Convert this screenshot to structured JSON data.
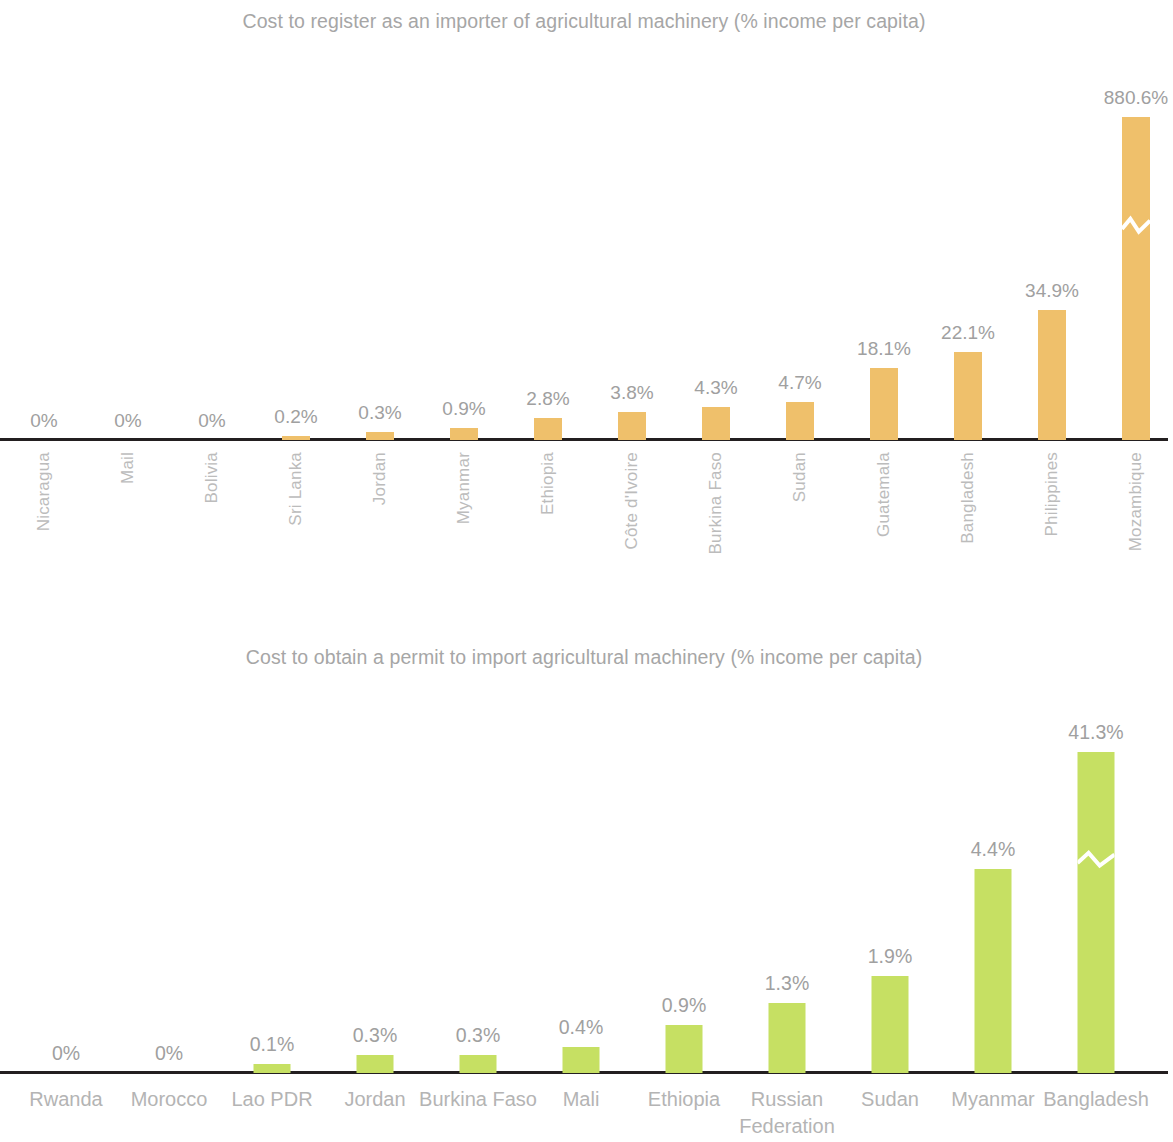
{
  "chart_data": [
    {
      "type": "bar",
      "title": "Cost to register as an importer of agricultural machinery (% income per capita)",
      "xlabel": "",
      "ylabel": "% income per capita",
      "grid": false,
      "legend": "none",
      "axis_break": true,
      "axis_break_category": "Mozambique",
      "bar_color": "#efc06b",
      "label_color": "#a0a0a0",
      "axis_color": "#231f20",
      "tick_label_orientation": "vertical",
      "categories": [
        "Nicaragua",
        "Mail",
        "Bolivia",
        "Sri Lanka",
        "Jordan",
        "Myanmar",
        "Ethiopia",
        "Côte d'Ivoire",
        "Burkina Faso",
        "Sudan",
        "Guatemala",
        "Bangladesh",
        "Philippines",
        "Mozambique"
      ],
      "values": [
        0,
        0,
        0,
        0.2,
        0.3,
        0.9,
        2.8,
        3.8,
        4.3,
        4.7,
        18.1,
        22.1,
        34.9,
        880.6
      ],
      "value_labels": [
        "0%",
        "0%",
        "0%",
        "0.2%",
        "0.3%",
        "0.9%",
        "2.8%",
        "3.8%",
        "4.3%",
        "4.7%",
        "18.1%",
        "22.1%",
        "34.9%",
        "880.6%"
      ],
      "bar_pixel_heights": [
        0,
        0,
        0,
        4,
        8,
        12,
        22,
        28,
        33,
        38,
        72,
        88,
        130,
        323
      ],
      "ylim": [
        0,
        900
      ]
    },
    {
      "type": "bar",
      "title": "Cost to obtain a permit to import agricultural machinery (% income per capita)",
      "xlabel": "",
      "ylabel": "% income per capita",
      "grid": false,
      "legend": "none",
      "axis_break": true,
      "axis_break_category": "Bangladesh",
      "bar_color": "#c6e063",
      "label_color": "#a0a0a0",
      "axis_color": "#231f20",
      "tick_label_orientation": "horizontal",
      "categories": [
        "Rwanda",
        "Morocco",
        "Lao PDR",
        "Jordan",
        "Burkina Faso",
        "Mali",
        "Ethiopia",
        "Russian Federation",
        "Sudan",
        "Myanmar",
        "Bangladesh"
      ],
      "values": [
        0,
        0,
        0.1,
        0.3,
        0.3,
        0.4,
        0.9,
        1.3,
        1.9,
        4.4,
        41.3
      ],
      "value_labels": [
        "0%",
        "0%",
        "0.1%",
        "0.3%",
        "0.3%",
        "0.4%",
        "0.9%",
        "1.3%",
        "1.9%",
        "4.4%",
        "41.3%"
      ],
      "bar_pixel_heights": [
        0,
        0,
        9,
        18,
        18,
        26,
        48,
        70,
        97,
        204,
        321
      ],
      "ylim": [
        0,
        45
      ]
    }
  ],
  "chart1": {
    "title": "Cost to register as an importer of agricultural machinery (% income per capita)",
    "bars": [
      {
        "category": "Nicaragua",
        "value_label": "0%"
      },
      {
        "category": "Mail",
        "value_label": "0%"
      },
      {
        "category": "Bolivia",
        "value_label": "0%"
      },
      {
        "category": "Sri Lanka",
        "value_label": "0.2%"
      },
      {
        "category": "Jordan",
        "value_label": "0.3%"
      },
      {
        "category": "Myanmar",
        "value_label": "0.9%"
      },
      {
        "category": "Ethiopia",
        "value_label": "2.8%"
      },
      {
        "category": "Côte d'Ivoire",
        "value_label": "3.8%"
      },
      {
        "category": "Burkina Faso",
        "value_label": "4.3%"
      },
      {
        "category": "Sudan",
        "value_label": "4.7%"
      },
      {
        "category": "Guatemala",
        "value_label": "18.1%"
      },
      {
        "category": "Bangladesh",
        "value_label": "22.1%"
      },
      {
        "category": "Philippines",
        "value_label": "34.9%"
      },
      {
        "category": "Mozambique",
        "value_label": "880.6%"
      }
    ]
  },
  "chart2": {
    "title": "Cost to obtain a permit to import agricultural machinery (% income per capita)",
    "bars": [
      {
        "category": "Rwanda",
        "value_label": "0%"
      },
      {
        "category": "Morocco",
        "value_label": "0%"
      },
      {
        "category": "Lao PDR",
        "value_label": "0.1%"
      },
      {
        "category": "Jordan",
        "value_label": "0.3%"
      },
      {
        "category": "Burkina Faso",
        "value_label": "0.3%"
      },
      {
        "category": "Mali",
        "value_label": "0.4%"
      },
      {
        "category": "Ethiopia",
        "value_label": "0.9%"
      },
      {
        "category": "Russian Federation",
        "value_label": "1.3%"
      },
      {
        "category": "Sudan",
        "value_label": "1.9%"
      },
      {
        "category": "Myanmar",
        "value_label": "4.4%"
      },
      {
        "category": "Bangladesh",
        "value_label": "41.3%"
      }
    ]
  }
}
